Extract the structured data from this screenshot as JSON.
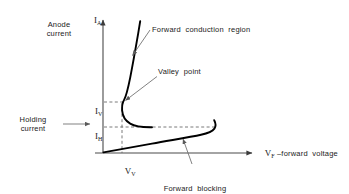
{
  "figure": {
    "axes": {
      "y_axis_symbol_label": "I",
      "y_axis_symbol_sub": "A",
      "y_axis_description": "Anode\ncurrent",
      "x_axis_label": "V",
      "x_axis_label_sub": "F",
      "x_axis_label_rest": " –forward  voltage"
    },
    "markers": {
      "valley_current_label": "I",
      "valley_current_sub": "V",
      "holding_current_label": "I",
      "holding_current_sub": "H",
      "valley_voltage_label": "V",
      "valley_voltage_sub": "V",
      "holding_current_description": "Holding\ncurrent"
    },
    "annotations": {
      "forward_conduction": "Forward  conduction  region",
      "valley_point": "Valley  point",
      "forward_blocking_line1": "Forward  blocking",
      "forward_blocking_line2": "region"
    },
    "colors": {
      "curve": "#000000",
      "axis": "#4a4a4a",
      "dashed": "#6b6b6b",
      "leader": "#6b6b6b",
      "background": "#ffffff"
    }
  },
  "chart_data": {
    "type": "line",
    "xlabel": "V_F –forward voltage",
    "ylabel": "I_A – Anode current",
    "grid": false,
    "legend": null,
    "axis_origin_px": [
      103,
      153
    ],
    "xlim_px": [
      103,
      258
    ],
    "ylim_px": [
      153,
      18
    ],
    "reference_levels": {
      "I_V": 102,
      "I_H": 127,
      "V_V": 122
    },
    "series": [
      {
        "name": "Forward blocking region",
        "description": "Low-current branch rising slowly from origin then breaking over sharply at the breakover voltage up to the holding current level",
        "points_px": [
          [
            103,
            152
          ],
          [
            118,
            148
          ],
          [
            136,
            145
          ],
          [
            158,
            141
          ],
          [
            180,
            138
          ],
          [
            196,
            135
          ],
          [
            205,
            133
          ],
          [
            211,
            131
          ],
          [
            214,
            128
          ],
          [
            215,
            124
          ],
          [
            214,
            120
          ]
        ]
      },
      {
        "name": "Negative resistance / valley transition",
        "description": "Branch from the holding-current knee back left and up through the valley point",
        "points_px": [
          [
            152,
            127
          ],
          [
            140,
            127
          ],
          [
            131,
            125
          ],
          [
            125,
            120
          ],
          [
            122,
            112
          ],
          [
            122,
            104
          ],
          [
            124,
            100
          ]
        ]
      },
      {
        "name": "Forward conduction region",
        "description": "Steeply rising on-state branch above the valley point",
        "points_px": [
          [
            124,
            100
          ],
          [
            126,
            92
          ],
          [
            128,
            82
          ],
          [
            131,
            70
          ],
          [
            133,
            58
          ],
          [
            136,
            42
          ],
          [
            139,
            25
          ],
          [
            140,
            21
          ]
        ]
      }
    ],
    "annotations": [
      {
        "text": "Forward  conduction  region",
        "anchor_px": [
          131,
          58
        ],
        "label_px": [
          152,
          30
        ]
      },
      {
        "text": "Valley  point",
        "anchor_px": [
          123,
          102
        ],
        "label_px": [
          157,
          72
        ]
      },
      {
        "text": "Forward  blocking",
        "anchor_px": [
          196,
          136
        ],
        "label_px": [
          195,
          169
        ]
      },
      {
        "text": "Holding\ncurrent",
        "anchor_px": [
          92,
          124
        ],
        "label_px": [
          30,
          120
        ]
      }
    ]
  }
}
